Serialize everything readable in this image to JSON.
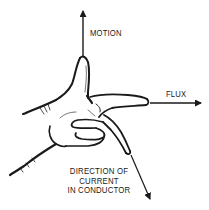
{
  "diagram": {
    "labels": {
      "motion": "MOTION",
      "flux": "FLUX",
      "current_line1": "DIRECTION OF",
      "current_line2": "CURRENT",
      "current_line3": "IN CONDUCTOR"
    },
    "arrows": [
      {
        "name": "motion",
        "direction": "up",
        "finger": "thumb"
      },
      {
        "name": "flux",
        "direction": "right",
        "finger": "index"
      },
      {
        "name": "current",
        "direction": "down-right",
        "finger": "middle"
      }
    ],
    "colors": {
      "ink": "#1a1a1a",
      "background": "#ffffff"
    }
  }
}
